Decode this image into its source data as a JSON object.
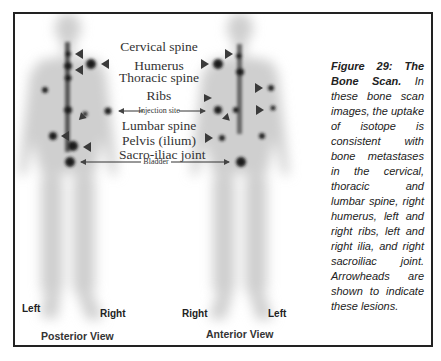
{
  "figure": {
    "number_label": "Figure 29:",
    "title": "The Bone Scan.",
    "caption_body": "In these bone scan images, the uptake of isotope is consistent with bone metastases in the cervical, thoracic and lumbar spine, right humerus, left and right ribs, left and right ilia, and right sacroiliac joint. Arrowheads are shown to indicate these lesions."
  },
  "labels": {
    "cervical_spine": "Cervical spine",
    "humerus": "Humerus",
    "thoracic_spine": "Thoracic spine",
    "ribs": "Ribs",
    "injection_site": "Injection site",
    "lumbar_spine": "Lumbar spine",
    "pelvis": "Pelvis (ilium)",
    "sacro_iliac": "Sacro-iliac joint",
    "bladder": "Bladder"
  },
  "views": {
    "posterior": {
      "title": "Posterior View",
      "left": "Left",
      "right": "Right"
    },
    "anterior": {
      "title": "Anterior View",
      "left": "Left",
      "right": "Right"
    }
  },
  "colors": {
    "frame": "#222222",
    "uptake": "#1a1a1a",
    "body_tint": "#d8d8d8",
    "arrow": "#3a3a3a"
  }
}
